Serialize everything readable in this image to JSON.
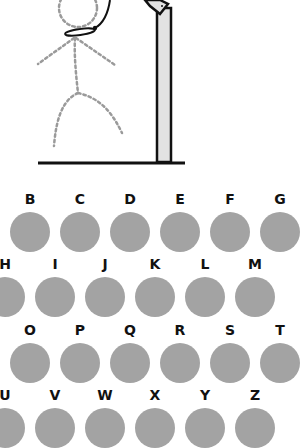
{
  "game": {
    "name": "Hangman",
    "colors": {
      "key_fill": "#a3a3a3",
      "pole_fill": "#e2e2e2",
      "figure_dots": "#9a9a9a",
      "outline": "#111111"
    }
  },
  "keyboard": {
    "rows": [
      {
        "offset": -40,
        "top": 192,
        "letters": [
          "A",
          "B",
          "C",
          "D",
          "E",
          "F",
          "G"
        ]
      },
      {
        "offset": -15,
        "top": 257,
        "letters": [
          "H",
          "I",
          "J",
          "K",
          "L",
          "M"
        ]
      },
      {
        "offset": -40,
        "top": 323,
        "letters": [
          "N",
          "O",
          "P",
          "Q",
          "R",
          "S",
          "T"
        ]
      },
      {
        "offset": -15,
        "top": 388,
        "letters": [
          "U",
          "V",
          "W",
          "X",
          "Y",
          "Z"
        ]
      }
    ],
    "visible_letters": [
      "B",
      "C",
      "D",
      "E",
      "F",
      "G",
      "I",
      "J",
      "K",
      "L",
      "M",
      "O",
      "P",
      "Q",
      "R",
      "S",
      "T",
      "V",
      "W",
      "X",
      "Y",
      "Z"
    ]
  }
}
